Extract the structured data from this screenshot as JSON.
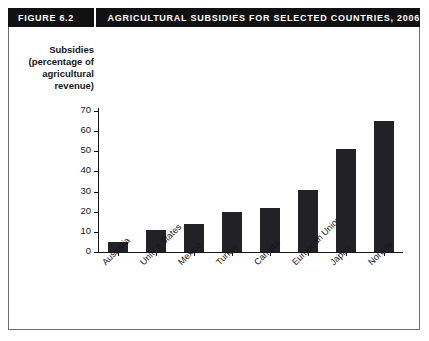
{
  "header": {
    "figure_label": "FIGURE 6.2",
    "title": "AGRICULTURAL SUBSIDIES FOR SELECTED COUNTRIES, 2006"
  },
  "axis_title_lines": [
    "Subsidies",
    "(percentage of",
    "agricultural",
    "revenue)"
  ],
  "colors": {
    "bar": "#222226",
    "header_background": "#111114",
    "header_text": "#ffffff",
    "axis": "#16161a",
    "frame": "#6d6d73",
    "background": "#ffffff"
  },
  "chart_data": {
    "type": "bar",
    "title": "AGRICULTURAL SUBSIDIES FOR SELECTED COUNTRIES, 2006",
    "xlabel": "",
    "ylabel": "Subsidies (percentage of agricultural revenue)",
    "categories": [
      "Australia",
      "United States",
      "Mexico",
      "Turkey",
      "Canada",
      "European Union",
      "Japan",
      "Norway"
    ],
    "values": [
      5,
      11,
      14,
      20,
      22,
      31,
      51,
      65
    ],
    "ylim": [
      0,
      70
    ],
    "yticks": [
      0,
      10,
      20,
      30,
      40,
      50,
      60,
      70
    ],
    "ytick_labels": [
      "0",
      "10",
      "20",
      "30",
      "40",
      "50",
      "60",
      "70"
    ],
    "grid": false,
    "legend": false
  }
}
